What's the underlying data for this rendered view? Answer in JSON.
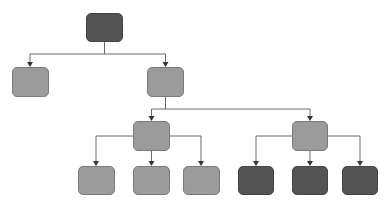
{
  "diagram": {
    "type": "tree",
    "colors": {
      "light_node": "#9b9b9b",
      "dark_node": "#545454",
      "edge": "#6a6a6a",
      "background": "#ffffff"
    },
    "nodes": [
      {
        "id": "root",
        "x": 86,
        "y": 13,
        "w": 37,
        "h": 29,
        "shade": "dark"
      },
      {
        "id": "l1-left",
        "x": 12,
        "y": 67,
        "w": 37,
        "h": 30,
        "shade": "light"
      },
      {
        "id": "l1-right",
        "x": 147,
        "y": 67,
        "w": 37,
        "h": 30,
        "shade": "light"
      },
      {
        "id": "l2-left",
        "x": 133,
        "y": 121,
        "w": 37,
        "h": 30,
        "shade": "light"
      },
      {
        "id": "l2-right",
        "x": 292,
        "y": 121,
        "w": 36,
        "h": 30,
        "shade": "light"
      },
      {
        "id": "l3-1",
        "x": 78,
        "y": 166,
        "w": 37,
        "h": 29,
        "shade": "light"
      },
      {
        "id": "l3-2",
        "x": 133,
        "y": 166,
        "w": 37,
        "h": 29,
        "shade": "light"
      },
      {
        "id": "l3-3",
        "x": 183,
        "y": 166,
        "w": 37,
        "h": 29,
        "shade": "light"
      },
      {
        "id": "l3-4",
        "x": 238,
        "y": 166,
        "w": 36,
        "h": 29,
        "shade": "dark"
      },
      {
        "id": "l3-5",
        "x": 292,
        "y": 166,
        "w": 36,
        "h": 29,
        "shade": "dark"
      },
      {
        "id": "l3-6",
        "x": 342,
        "y": 166,
        "w": 36,
        "h": 29,
        "shade": "dark"
      }
    ],
    "edges": [
      {
        "from": "root",
        "to": "l1-left"
      },
      {
        "from": "root",
        "to": "l1-right"
      },
      {
        "from": "l1-right",
        "to": "l2-left"
      },
      {
        "from": "l1-right",
        "to": "l2-right"
      },
      {
        "from": "l2-left",
        "to": "l3-1"
      },
      {
        "from": "l2-left",
        "to": "l3-2"
      },
      {
        "from": "l2-left",
        "to": "l3-3"
      },
      {
        "from": "l2-right",
        "to": "l3-4"
      },
      {
        "from": "l2-right",
        "to": "l3-5"
      },
      {
        "from": "l2-right",
        "to": "l3-6"
      }
    ],
    "paths": [
      {
        "name": "edge-root-to-l1",
        "d": "M104.5 42 V54 M30 54 H165.5 M30 54 V64 M165.5 54 V64"
      },
      {
        "name": "edge-l1right-to-l2",
        "d": "M165.5 97 V109 M151.5 109 H310 M151.5 109 V118 M310 109 V118"
      },
      {
        "name": "edge-l2left-to-l3",
        "d": "M133 136 H96 V163 M170 136 H201 V163 M151.5 151 V163"
      },
      {
        "name": "edge-l2right-to-l3",
        "d": "M292 136 H256 V163 M328 136 H360 V163 M310 151 V163"
      }
    ]
  }
}
